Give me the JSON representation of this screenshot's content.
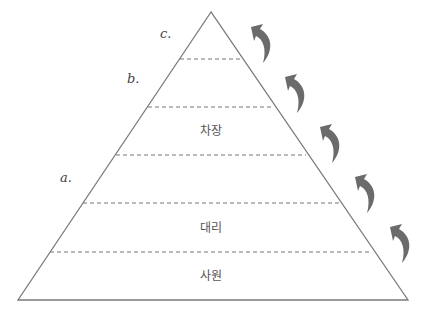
{
  "diagram": {
    "type": "pyramid",
    "levels_top_to_bottom": [
      {
        "label": "",
        "marker": "c."
      },
      {
        "label": "",
        "marker": "b."
      },
      {
        "label": "차장",
        "marker": ""
      },
      {
        "label": "",
        "marker": "a."
      },
      {
        "label": "대리",
        "marker": ""
      },
      {
        "label": "사원",
        "marker": ""
      }
    ],
    "markers": {
      "a": "a.",
      "b": "b.",
      "c": "c."
    },
    "labels": {
      "chajang": "차장",
      "daeri": "대리",
      "sawon": "사원"
    },
    "arrows": {
      "count": 5,
      "direction": "curved-up-left",
      "meaning": "promotion"
    },
    "colors": {
      "outline": "#7a7a7a",
      "arrow": "#6b6b6b",
      "text": "#555555"
    }
  }
}
